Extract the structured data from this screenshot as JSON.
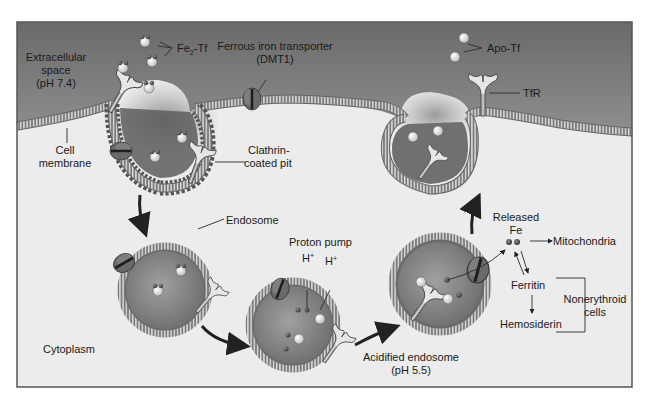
{
  "figure": {
    "colors": {
      "extracellular_top": "#6e6e6e",
      "extracellular_mid": "#8c8c8c",
      "cytoplasm": "#ececec",
      "membrane_outer": "#7a7a7a",
      "membrane_stripe": "#d8d8d8",
      "vesicle_lumen": "#8a8a8a",
      "transferrin": "#f4f4f4",
      "iron_atom": "#555555",
      "arrow": "#222222",
      "frame": "#555555"
    },
    "labels": {
      "extracellular": [
        "Extracellular",
        "space",
        "(pH 7.4)"
      ],
      "fe2tf_main": "Fe",
      "fe2tf_sub": "2",
      "fe2tf_rest": "-Tf",
      "dmt1": [
        "Ferrous iron transporter",
        "(DMT1)"
      ],
      "apo_tf": "Apo-Tf",
      "tfr": "TfR",
      "cell_membrane": [
        "Cell",
        "membrane"
      ],
      "clathrin": [
        "Clathrin-",
        "coated pit"
      ],
      "endosome": "Endosome",
      "proton_pump": "Proton pump",
      "h_plus_1": "H",
      "h_plus_2": "H",
      "plus": "+",
      "released_fe": [
        "Released",
        "Fe"
      ],
      "mitochondria": "Mitochondria",
      "ferritin": "Ferritin",
      "hemosiderin": "Hemosiderin",
      "nonerythroid": [
        "Nonerythroid",
        "cells"
      ],
      "acidified": [
        "Acidified endosome",
        "(pH 5.5)"
      ],
      "cytoplasm": "Cytoplasm"
    },
    "icons": {
      "transferrin_receptor": "y-shaped-receptor-icon",
      "dmt1_channel": "transporter-channel-icon",
      "iron": "iron-atom-icon",
      "transferrin": "transferrin-sphere-icon"
    }
  }
}
